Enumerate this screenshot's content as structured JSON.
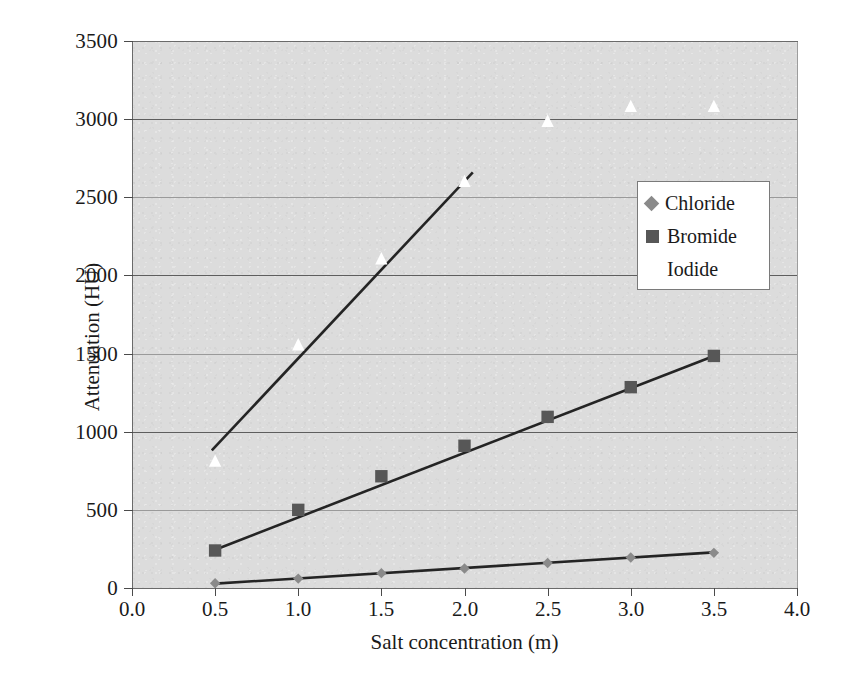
{
  "chart_data": {
    "type": "scatter",
    "title": "",
    "xlabel": "Salt concentration (m)",
    "ylabel": "Attenuation (HU)",
    "xlim": [
      0.0,
      4.0
    ],
    "ylim": [
      0,
      3500
    ],
    "xticks": [
      "0.0",
      "0.5",
      "1.0",
      "1.5",
      "2.0",
      "2.5",
      "3.0",
      "3.5",
      "4.0"
    ],
    "xtick_values": [
      0.0,
      0.5,
      1.0,
      1.5,
      2.0,
      2.5,
      3.0,
      3.5,
      4.0
    ],
    "yticks": [
      "0",
      "500",
      "1000",
      "1500",
      "2000",
      "2500",
      "3000",
      "3500"
    ],
    "ytick_values": [
      0,
      500,
      1000,
      1500,
      2000,
      2500,
      3000,
      3500
    ],
    "grid": "horizontal",
    "legend_position": "upper-right-inside",
    "x": [
      0.5,
      1.0,
      1.5,
      2.0,
      2.5,
      3.0,
      3.5
    ],
    "series": [
      {
        "name": "Chloride",
        "marker": "diamond",
        "color": "#8a8a8a",
        "values": [
          30,
          60,
          95,
          125,
          160,
          195,
          225
        ],
        "trendline": {
          "x0": 0.5,
          "y0": 28,
          "x1": 3.5,
          "y1": 228
        }
      },
      {
        "name": "Bromide",
        "marker": "square",
        "color": "#575757",
        "values": [
          240,
          500,
          715,
          910,
          1095,
          1285,
          1485
        ],
        "trendline": {
          "x0": 0.5,
          "y0": 245,
          "x1": 3.5,
          "y1": 1485
        }
      },
      {
        "name": "Iodide",
        "marker": "triangle",
        "color": "#ffffff",
        "values": [
          810,
          1555,
          2105,
          2600,
          2985,
          3080,
          3080
        ],
        "trendline": {
          "x0": 0.48,
          "y0": 880,
          "x1": 2.05,
          "y1": 2660
        }
      }
    ]
  },
  "legend": {
    "items": [
      {
        "label": "Chloride",
        "marker": "diamond"
      },
      {
        "label": "Bromide",
        "marker": "square"
      },
      {
        "label": "Iodide",
        "marker": "triangle"
      }
    ]
  },
  "axes": {
    "y_title": "Attenuation (HU)",
    "x_title": "Salt concentration (m)"
  },
  "colors": {
    "plot_background": "#dcdcdc",
    "page_background": "#ffffff",
    "gridline": "#5e5e5e",
    "chloride": "#8a8a8a",
    "bromide": "#575757",
    "iodide": "#ffffff",
    "trendline": "#242424"
  }
}
